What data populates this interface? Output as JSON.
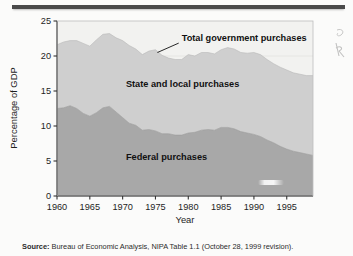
{
  "figure": {
    "source_label": "Source:",
    "source_text": " Bureau of Economic Analysis, NIPA Table 1.1 (October 28, 1999 revision)."
  },
  "colors": {
    "federal_fill": "#a8a8a8",
    "state_local_fill": "#cfcfcf",
    "plot_background": "#f2f2f0",
    "axis": "#333333",
    "rule": "#4a4a4a",
    "text": "#1e1e1e"
  },
  "chart_data": {
    "type": "area",
    "stacked": true,
    "title": "",
    "xlabel": "Year",
    "ylabel": "Percentage of GDP",
    "xlim": [
      1960,
      1999
    ],
    "ylim": [
      0,
      25
    ],
    "ytick_labels": [
      "0",
      "5",
      "10",
      "15",
      "20",
      "25"
    ],
    "yticks": [
      0,
      5,
      10,
      15,
      20,
      25
    ],
    "xtick_labels": [
      "1960",
      "1965",
      "1970",
      "1975",
      "1980",
      "1985",
      "1990",
      "1995"
    ],
    "xticks": [
      1960,
      1965,
      1970,
      1975,
      1980,
      1985,
      1990,
      1995
    ],
    "grid": false,
    "legend": "in-plot labels",
    "annotations": [
      {
        "name": "total-government-purchases",
        "text": "Total government purchases",
        "x": 1979.0,
        "y": 22.2,
        "leader_to_x": 1975.3,
        "leader_to_y": 20.5
      },
      {
        "name": "state-and-local-purchases",
        "text": "State and local purchases",
        "x": 1970.5,
        "y": 15.6
      },
      {
        "name": "federal-purchases",
        "text": "Federal purchases",
        "x": 1970.5,
        "y": 5.2
      }
    ],
    "x": [
      1960,
      1961,
      1962,
      1963,
      1964,
      1965,
      1966,
      1967,
      1968,
      1969,
      1970,
      1971,
      1972,
      1973,
      1974,
      1975,
      1976,
      1977,
      1978,
      1979,
      1980,
      1981,
      1982,
      1983,
      1984,
      1985,
      1986,
      1987,
      1988,
      1989,
      1990,
      1991,
      1992,
      1993,
      1994,
      1995,
      1996,
      1997,
      1998,
      1999
    ],
    "series": [
      {
        "name": "Federal purchases",
        "values": [
          12.5,
          12.6,
          12.9,
          12.5,
          11.8,
          11.4,
          11.9,
          12.6,
          12.8,
          12.0,
          11.2,
          10.4,
          10.1,
          9.4,
          9.5,
          9.3,
          8.9,
          8.9,
          8.7,
          8.7,
          9.0,
          9.1,
          9.4,
          9.5,
          9.4,
          9.8,
          9.8,
          9.6,
          9.2,
          9.0,
          8.8,
          8.5,
          8.0,
          7.6,
          7.1,
          6.7,
          6.4,
          6.2,
          6.0,
          5.8
        ]
      },
      {
        "name": "State and local purchases",
        "values": [
          9.1,
          9.4,
          9.3,
          9.7,
          10.0,
          10.0,
          10.4,
          10.5,
          10.4,
          10.6,
          11.0,
          11.1,
          10.9,
          10.8,
          11.2,
          11.6,
          11.2,
          10.8,
          10.8,
          10.8,
          11.2,
          10.9,
          11.1,
          11.0,
          10.9,
          11.1,
          11.4,
          11.4,
          11.3,
          11.4,
          11.7,
          11.7,
          11.5,
          11.3,
          11.3,
          11.3,
          11.2,
          11.2,
          11.2,
          11.4
        ]
      }
    ],
    "total_series": {
      "name": "Total government purchases",
      "values": [
        21.6,
        22.0,
        22.2,
        22.2,
        21.8,
        21.4,
        22.3,
        23.1,
        23.2,
        22.6,
        22.2,
        21.5,
        21.0,
        20.2,
        20.7,
        20.9,
        20.1,
        19.7,
        19.5,
        19.5,
        20.2,
        20.0,
        20.5,
        20.5,
        20.3,
        20.9,
        21.2,
        21.0,
        20.5,
        20.4,
        20.5,
        20.2,
        19.5,
        18.9,
        18.4,
        18.0,
        17.6,
        17.4,
        17.2,
        17.2
      ]
    }
  }
}
